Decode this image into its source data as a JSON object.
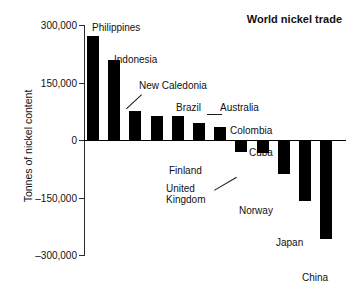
{
  "chart_data": {
    "type": "bar",
    "title": "World nickel trade",
    "xlabel": "",
    "ylabel": "Tonnes of nickel content",
    "ylim": [
      -300000,
      300000
    ],
    "grid": false,
    "legend": "none",
    "yticks": [
      "300,000",
      "150,000",
      "0",
      "–150,000",
      "–300,000"
    ],
    "ytick_values": [
      300000,
      150000,
      0,
      -150000,
      -300000
    ],
    "categories": [
      "Philippines",
      "Indonesia",
      "New Caledonia",
      "Brazil",
      "Australia",
      "Colombia",
      "Cuba",
      "Finland",
      "United Kingdom",
      "Norway",
      "Japan",
      "China"
    ],
    "values": [
      272000,
      208000,
      75000,
      62000,
      62000,
      44000,
      33000,
      -30000,
      -33000,
      -88000,
      -160000,
      -258000
    ],
    "bars": [
      {
        "name": "Philippines",
        "value": 272000,
        "label": "Philippines",
        "label_x": 8,
        "label_y": -3,
        "leader": null
      },
      {
        "name": "Indonesia",
        "value": 208000,
        "label": "Indonesia",
        "label_x": 30,
        "label_y": 29,
        "leader": null
      },
      {
        "name": "New Caledonia",
        "value": 75000,
        "label": "New Caledonia",
        "label_x": 55,
        "label_y": 55,
        "leader": {
          "x1": 58,
          "y1": 70,
          "x2": 43,
          "y2": 84
        }
      },
      {
        "name": "Brazil",
        "value": 62000,
        "label": "Brazil",
        "label_x": 92,
        "label_y": 77,
        "leader": {
          "x1": 96,
          "y1": 90,
          "x2": 96,
          "y2": 90
        }
      },
      {
        "name": "Australia",
        "value": 62000,
        "label": "Australia",
        "label_x": 136,
        "label_y": 77,
        "leader": {
          "x1": 138,
          "y1": 90,
          "x2": 123,
          "y2": 90
        }
      },
      {
        "name": "Colombia",
        "value": 44000,
        "label": "Colombia",
        "label_x": 146,
        "label_y": 100,
        "leader": null
      },
      {
        "name": "Cuba",
        "value": 33000,
        "label": "Cuba",
        "label_x": 165,
        "label_y": 122,
        "leader": null
      },
      {
        "name": "Finland",
        "value": -30000,
        "label": "Finland",
        "label_x": 85,
        "label_y": 140,
        "leader": null
      },
      {
        "name": "United Kingdom",
        "value": -33000,
        "label": "United\nKingdom",
        "label_x": 82,
        "label_y": 158,
        "leader": {
          "x1": 130,
          "y1": 165,
          "x2": 152,
          "y2": 152
        }
      },
      {
        "name": "Norway",
        "value": -88000,
        "label": "Norway",
        "label_x": 155,
        "label_y": 180,
        "leader": null
      },
      {
        "name": "Japan",
        "value": -160000,
        "label": "Japan",
        "label_x": 192,
        "label_y": 212,
        "leader": null
      },
      {
        "name": "China",
        "value": -258000,
        "label": "China",
        "label_x": 218,
        "label_y": 247,
        "leader": null
      }
    ]
  },
  "axis": {
    "y_title": "Tonnes of nickel content"
  }
}
